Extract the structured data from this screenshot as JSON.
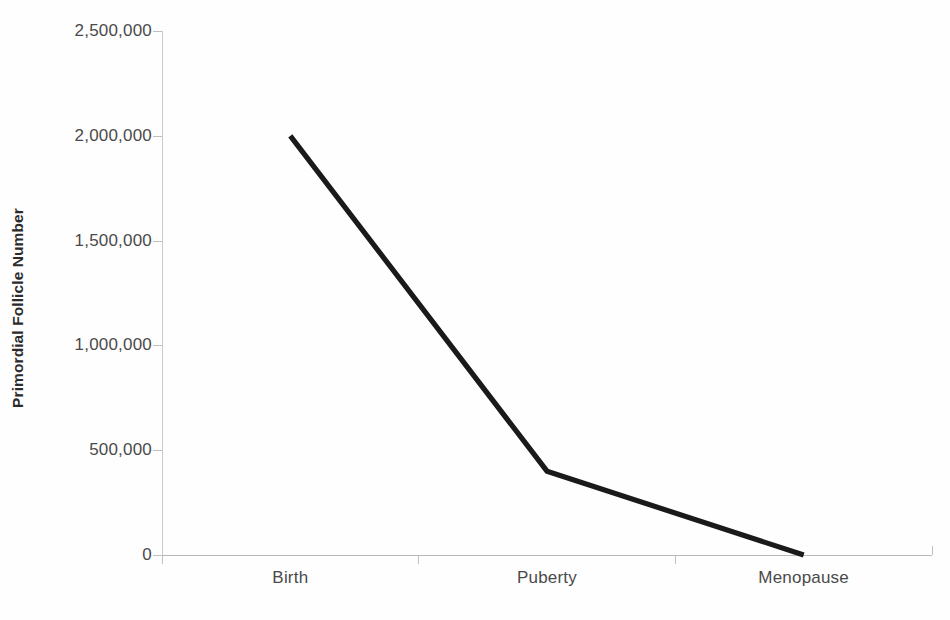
{
  "chart_data": {
    "type": "line",
    "title": "",
    "xlabel": "",
    "ylabel": "Primordial Follicle Number",
    "categories": [
      "Birth",
      "Puberty",
      "Menopause"
    ],
    "values": [
      2000000,
      400000,
      0
    ],
    "series": [
      {
        "name": "Primordial Follicle Number",
        "values": [
          2000000,
          400000,
          0
        ],
        "color": "#1a1a1a"
      }
    ],
    "ylim": [
      0,
      2500000
    ],
    "ytick_values": [
      0,
      500000,
      1000000,
      1500000,
      2000000,
      2500000
    ],
    "ytick_labels": [
      "0",
      "500,000",
      "1,000,000",
      "1,500,000",
      "2,000,000",
      "2,500,000"
    ],
    "grid": false,
    "legend": false,
    "markers": false,
    "axis_color": "#c0c0c0",
    "line_color": "#1a1a1a"
  },
  "axes": {
    "y": {
      "title": "Primordial Follicle Number",
      "ticks": [
        {
          "label": "2,500,000",
          "value": 2500000
        },
        {
          "label": "2,000,000",
          "value": 2000000
        },
        {
          "label": "1,500,000",
          "value": 1500000
        },
        {
          "label": "1,000,000",
          "value": 1000000
        },
        {
          "label": "500,000",
          "value": 500000
        },
        {
          "label": "0",
          "value": 0
        }
      ]
    },
    "x": {
      "title": "",
      "ticks": [
        {
          "label": "Birth"
        },
        {
          "label": "Puberty"
        },
        {
          "label": "Menopause"
        }
      ]
    }
  }
}
